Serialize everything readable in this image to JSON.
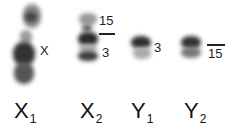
{
  "figure": {
    "chromosomes": [
      {
        "id": "X1",
        "main": "X",
        "sub": "1",
        "annotation": "X"
      },
      {
        "id": "X2",
        "main": "X",
        "sub": "2",
        "annotations": [
          "15",
          "3"
        ]
      },
      {
        "id": "Y1",
        "main": "Y",
        "sub": "1",
        "annotation": "3"
      },
      {
        "id": "Y2",
        "main": "Y",
        "sub": "2",
        "annotation": "15"
      }
    ]
  }
}
